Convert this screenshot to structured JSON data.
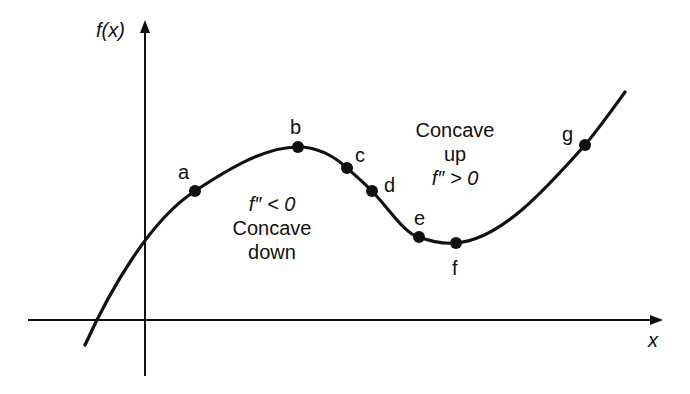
{
  "diagram": {
    "y_axis_label": "f(x)",
    "x_axis_label": "x",
    "points": [
      {
        "id": "a",
        "label": "a",
        "x": 195,
        "y": 191
      },
      {
        "id": "b",
        "label": "b",
        "x": 298,
        "y": 147
      },
      {
        "id": "c",
        "label": "c",
        "x": 347,
        "y": 168
      },
      {
        "id": "d",
        "label": "d",
        "x": 372,
        "y": 191
      },
      {
        "id": "e",
        "label": "e",
        "x": 419,
        "y": 237
      },
      {
        "id": "f",
        "label": "f",
        "x": 456,
        "y": 243
      },
      {
        "id": "g",
        "label": "g",
        "x": 585,
        "y": 145
      }
    ],
    "region_down": {
      "condition": "f″ < 0",
      "line1": "Concave",
      "line2": "down"
    },
    "region_up": {
      "line1": "Concave",
      "line2": "up",
      "condition": "f″ > 0"
    },
    "colors": {
      "ink": "#111111",
      "background": "#ffffff"
    }
  }
}
